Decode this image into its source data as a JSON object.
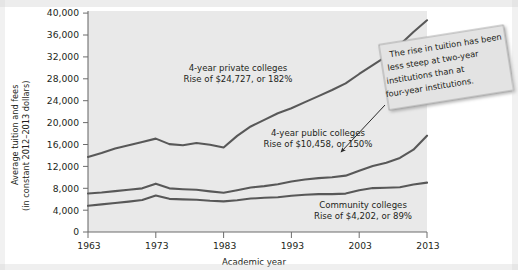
{
  "chart_data": {
    "type": "line",
    "title": "",
    "xlabel": "Academic year",
    "ylabel": "Average tuition and fees\n(in constant 2012–2013 dollars)",
    "ylabel_line1": "Average tuition and fees",
    "ylabel_line2": "(in constant 2012–2013 dollars)",
    "xlim": [
      1963,
      2013
    ],
    "ylim": [
      0,
      40000
    ],
    "xticks": [
      1963,
      1973,
      1983,
      1993,
      2003,
      2013
    ],
    "xtick_labels": [
      "1963",
      "1973",
      "1983",
      "1993",
      "2003",
      "2013"
    ],
    "yticks": [
      0,
      4000,
      8000,
      12000,
      16000,
      20000,
      24000,
      28000,
      32000,
      36000,
      40000
    ],
    "ytick_labels": [
      "0",
      "4,000",
      "8,000",
      "12,000",
      "16,000",
      "20,000",
      "24,000",
      "28,000",
      "32,000",
      "36,000",
      "40,000"
    ],
    "grid": false,
    "legend_position": "inline-annotations",
    "plot_bg": "#e9e9e9",
    "line_color": "#595959",
    "x": [
      1963,
      1965,
      1967,
      1969,
      1971,
      1973,
      1975,
      1977,
      1979,
      1981,
      1983,
      1985,
      1987,
      1989,
      1991,
      1993,
      1995,
      1997,
      1999,
      2001,
      2003,
      2005,
      2007,
      2009,
      2011,
      2013
    ],
    "series": [
      {
        "name": "4-year private colleges",
        "values": [
          13590,
          14300,
          15100,
          15700,
          16300,
          16900,
          15900,
          15700,
          16100,
          15800,
          15300,
          17400,
          19100,
          20300,
          21500,
          22400,
          23500,
          24600,
          25700,
          26900,
          28600,
          30200,
          31800,
          33900,
          36200,
          38317
        ]
      },
      {
        "name": "4-year public colleges",
        "values": [
          6970,
          7150,
          7400,
          7650,
          7900,
          8750,
          7900,
          7750,
          7650,
          7350,
          7100,
          7550,
          8050,
          8300,
          8650,
          9150,
          9500,
          9750,
          9900,
          10200,
          11100,
          11950,
          12550,
          13400,
          14900,
          17428
        ]
      },
      {
        "name": "Community colleges",
        "values": [
          4740,
          5000,
          5250,
          5500,
          5800,
          6600,
          6000,
          5900,
          5850,
          5650,
          5550,
          5750,
          6050,
          6200,
          6300,
          6550,
          6750,
          6850,
          6850,
          6950,
          7550,
          7950,
          8000,
          8100,
          8600,
          8942
        ]
      }
    ],
    "annotations": [
      {
        "name": "private-annotation",
        "line1": "4-year private colleges",
        "line2": "Rise of $24,727, or 182%"
      },
      {
        "name": "public-annotation",
        "line1": "4-year public colleges",
        "line2": "Rise of $10,458, or 150%"
      },
      {
        "name": "community-annotation",
        "line1": "Community colleges",
        "line2": "Rise of $4,202, or 89%"
      }
    ],
    "callout_note": {
      "line1": "The rise in tuition has been",
      "line2": "less steep at two-year",
      "line3": "institutions than at",
      "line4": "four-year institutions."
    }
  }
}
